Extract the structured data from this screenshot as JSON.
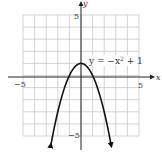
{
  "chart_data": {
    "type": "line",
    "title": "",
    "xlabel": "x",
    "ylabel": "y",
    "xlim": [
      -5,
      5
    ],
    "ylim": [
      -5,
      5
    ],
    "grid": true,
    "x_tick_labels": [
      "-5",
      "5"
    ],
    "y_tick_labels": [
      "5",
      "-5"
    ],
    "series": [
      {
        "name": "y = -x^2 + 1",
        "equation": "y = -x^2 + 1",
        "x": [
          -2.6,
          -2,
          -1.5,
          -1,
          -0.5,
          0,
          0.5,
          1,
          1.5,
          2,
          2.6
        ],
        "values": [
          -5.76,
          -3,
          -1.25,
          0,
          0.75,
          1,
          0.75,
          0,
          -1.25,
          -3,
          -5.76
        ],
        "arrows_at_ends": true
      }
    ],
    "annotations": [
      {
        "text": "y = −x² + 1",
        "x": 2.3,
        "y": 1.6
      }
    ]
  },
  "labels": {
    "x_axis": "x",
    "y_axis": "y",
    "x_min": "−5",
    "x_max": "5",
    "y_max": "5",
    "y_min": "−5",
    "equation": "y = −x",
    "equation_sup": "2",
    "equation_tail": " + 1"
  },
  "colors": {
    "grid": "#c8c8c8",
    "axis": "#222222",
    "curve": "#111111"
  }
}
